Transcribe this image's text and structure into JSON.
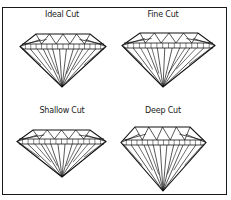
{
  "diagram": {
    "panels": [
      {
        "label": "Ideal Cut",
        "label_pos": [
          62,
          10
        ],
        "table": [
          36,
          90,
          34
        ],
        "girdle": [
          20,
          106,
          44,
          49
        ],
        "culet": [
          62,
          87
        ]
      },
      {
        "label": "Fine Cut",
        "label_pos": [
          163,
          10
        ],
        "table": [
          140,
          198,
          33
        ],
        "girdle": [
          122,
          215,
          43,
          48
        ],
        "culet": [
          163,
          87
        ]
      },
      {
        "label": "Shallow Cut",
        "label_pos": [
          62,
          106
        ],
        "table": [
          33,
          90,
          130
        ],
        "girdle": [
          17,
          106,
          139,
          144
        ],
        "culet": [
          62,
          177
        ]
      },
      {
        "label": "Deep Cut",
        "label_pos": [
          163,
          106
        ],
        "table": [
          135,
          190,
          127
        ],
        "girdle": [
          121,
          206,
          140,
          145
        ],
        "culet": [
          163,
          191
        ]
      }
    ],
    "colors": {
      "line": "#111111",
      "background": "#ffffff",
      "frame": "#1a1a1a"
    }
  }
}
